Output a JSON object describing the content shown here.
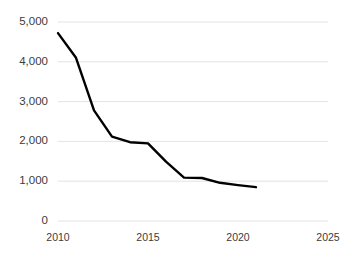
{
  "chart_data": {
    "type": "line",
    "title": "",
    "subtitle": "",
    "xlabel": "",
    "ylabel": "",
    "x": [
      2010,
      2011,
      2012,
      2013,
      2014,
      2015,
      2016,
      2017,
      2018,
      2019,
      2020,
      2021
    ],
    "series": [
      {
        "name": "",
        "values": [
          4720,
          4100,
          2780,
          2120,
          1980,
          1950,
          1490,
          1090,
          1080,
          960,
          900,
          850
        ]
      }
    ],
    "xlim": [
      2010,
      2025
    ],
    "ylim": [
      0,
      5000
    ],
    "xticks": [
      2010,
      2015,
      2020,
      2025
    ],
    "xtick_labels": [
      "2010",
      "2015",
      "2020",
      "2025"
    ],
    "yticks": [
      0,
      1000,
      2000,
      3000,
      4000,
      5000
    ],
    "ytick_labels": [
      "0",
      "1,000",
      "2,000",
      "3,000",
      "4,000",
      "5,000"
    ],
    "grid": "horizontal",
    "legend": "none",
    "annotations": [],
    "colors": {
      "line": "#000000",
      "grid": "#e3e3e3",
      "axis_text": "#3b3b3b",
      "background": "#ffffff"
    },
    "line_width": 2.4
  }
}
